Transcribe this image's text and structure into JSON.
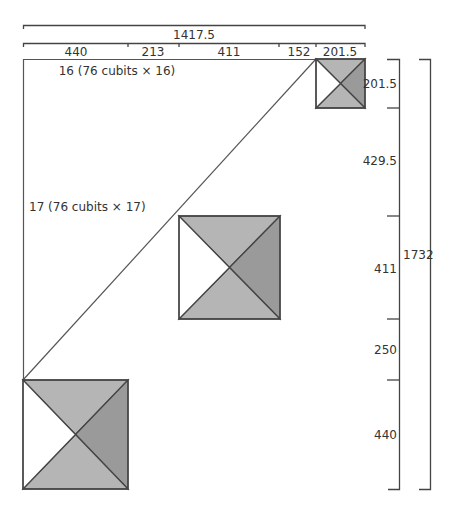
{
  "colors": {
    "line": "#444444",
    "face_light": "#b5b5b5",
    "face_dark": "#9a9a9a",
    "face_white": "#ffffff"
  },
  "top_dimensions": {
    "total_label": "1417.5",
    "segments": [
      "440",
      "213",
      "411",
      "152",
      "201.5"
    ]
  },
  "right_dimensions": {
    "total_label": "1732",
    "segments": [
      "201.5",
      "429.5",
      "411",
      "250",
      "440"
    ]
  },
  "annotations": {
    "top_edge": "16 (76 cubits × 16)",
    "diagonal": "17 (76 cubits × 17)"
  },
  "pyramids": [
    {
      "name": "small-pyramid",
      "x": 316,
      "y": 59,
      "size": 49
    },
    {
      "name": "middle-pyramid",
      "x": 179,
      "y": 216,
      "size": 101
    },
    {
      "name": "large-pyramid",
      "x": 23,
      "y": 380,
      "size": 107
    }
  ]
}
